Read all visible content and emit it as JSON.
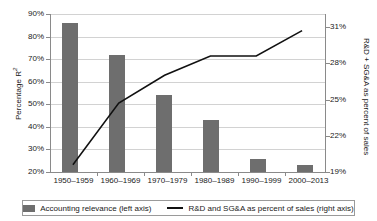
{
  "chart_data": {
    "type": "bar",
    "title": "",
    "subtitle": "",
    "categories": [
      "1950–1959",
      "1960–1969",
      "1970–1979",
      "1980–1989",
      "1990–1999",
      "2000–2013"
    ],
    "series": [
      {
        "name": "Accounting relevance (left axis)",
        "type": "bar",
        "axis": "left",
        "values": [
          86,
          72,
          54,
          43,
          26,
          23
        ],
        "color": "#6e6e6e"
      },
      {
        "name": "R&D and SG&A as percent of sales (right axis)",
        "type": "line",
        "axis": "right",
        "values": [
          19.6,
          24.7,
          27.0,
          28.6,
          28.6,
          30.7
        ],
        "color": "#111111"
      }
    ],
    "xlabel": "",
    "ylabel": "Percentage R²",
    "y2label": "R&D + SG&A as percent of sales",
    "yticks": [
      "20%",
      "30%",
      "40%",
      "50%",
      "60%",
      "70%",
      "80%",
      "90%"
    ],
    "ytick_values": [
      20,
      30,
      40,
      50,
      60,
      70,
      80,
      90
    ],
    "ylim": [
      20,
      90
    ],
    "y2ticks": [
      "19%",
      "22%",
      "25%",
      "28%",
      "31%"
    ],
    "y2tick_values": [
      19,
      22,
      25,
      28,
      31
    ],
    "y2lim": [
      19,
      32.25
    ],
    "grid": true,
    "legend_position": "bottom"
  },
  "legend": {
    "bar_label": "Accounting relevance (left axis)",
    "line_label": "R&D and SG&A as percent of sales (right axis)"
  },
  "axes": {
    "left_title_main": "Percentage R",
    "left_title_sup": "2",
    "right_title": "R&D + SG&A as percent of sales"
  }
}
